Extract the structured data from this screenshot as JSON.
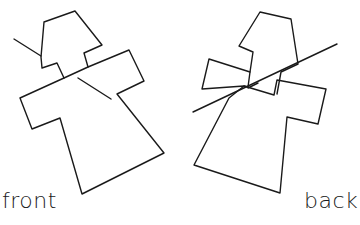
{
  "figures": [
    {
      "id": "front",
      "label": "front"
    },
    {
      "id": "back",
      "label": "back"
    }
  ],
  "colors": {
    "ink": "#1a1a1a",
    "background": "#ffffff"
  }
}
